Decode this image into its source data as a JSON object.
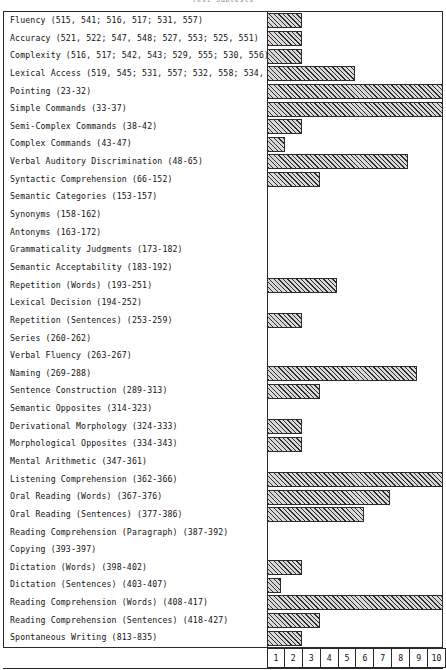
{
  "chart": {
    "title": "Test Subtests",
    "frame_border_color": "#2a2a2a",
    "bar_fill_color": "#d9d9d9",
    "bar_hatch_color": "#2e2e2e"
  },
  "chart_data": {
    "type": "bar",
    "orientation": "horizontal",
    "title": "Test Subtests",
    "xlabel": "",
    "ylabel": "",
    "xlim": [
      0,
      10
    ],
    "grid": false,
    "legend": null,
    "xticks": [
      "1",
      "2",
      "3",
      "4",
      "5",
      "6",
      "7",
      "8",
      "9",
      "10"
    ],
    "categories": [
      "Fluency (515, 541; 516, 517; 531, 557)",
      "Accuracy (521, 522; 547, 548; 527, 553; 525, 551)",
      "Complexity (516, 517; 542, 543; 529, 555; 530, 556)",
      "Lexical Access (519, 545; 531, 557; 532, 558; 534, 560)",
      "Pointing (23-32)",
      "Simple Commands (33-37)",
      "Semi-Complex Commands (38-42)",
      "Complex Commands (43-47)",
      "Verbal Auditory Discrimination (48-65)",
      "Syntactic Comprehension (66-152)",
      "Semantic Categories (153-157)",
      "Synonyms (158-162)",
      "Antonyms (163-172)",
      "Grammaticality Judgments (173-182)",
      "Semantic Acceptability (183-192)",
      "Repetition (Words) (193-251)",
      "Lexical Decision (194-252)",
      "Repetition (Sentences) (253-259)",
      "Series (260-262)",
      "Verbal Fluency (263-267)",
      "Naming (269-288)",
      "Sentence Construction (289-313)",
      "Semantic Opposites (314-323)",
      "Derivational Morphology (324-333)",
      "Morphological Opposites (334-343)",
      "Mental Arithmetic (347-361)",
      "Listening Comprehension (362-366)",
      "Oral Reading (Words) (367-376)",
      "Oral Reading (Sentences) (377-386)",
      "Reading Comprehension (Paragraph) (387-392)",
      "Copying (393-397)",
      "Dictation (Words) (398-402)",
      "Dictation (Sentences) (403-407)",
      "Reading Comprehension (Words) (408-417)",
      "Reading Comprehension (Sentences) (418-427)",
      "Spontaneous Writing (813-835)"
    ],
    "values": [
      2,
      2,
      2,
      5,
      10,
      10,
      2,
      1,
      8,
      3,
      0,
      0,
      0,
      0,
      0,
      4,
      0,
      2,
      0,
      0,
      8.5,
      3,
      0,
      2,
      2,
      0,
      10,
      7,
      5.5,
      0,
      0,
      2,
      0.8,
      10,
      3,
      2
    ]
  }
}
